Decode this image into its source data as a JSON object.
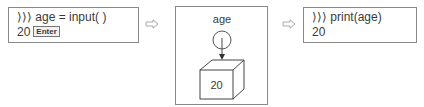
{
  "step1": {
    "line1": "⟩⟩⟩ age = input( )",
    "line2_value": "20",
    "key_label": "Enter"
  },
  "step2": {
    "variable_name": "age",
    "box_value": "20"
  },
  "step3": {
    "line1": "⟩⟩⟩ print(age)",
    "line2": "20"
  },
  "flow_arrows": [
    "⇨",
    "⇨"
  ]
}
